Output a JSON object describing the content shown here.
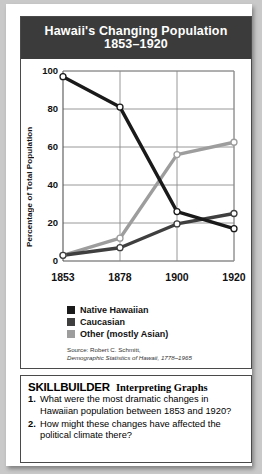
{
  "figure": {
    "title_line1": "Hawaii's Changing Population",
    "title_line2": "1853–1920",
    "source_line1": "Source: Robert C. Schmitt,",
    "source_line2": "Demographic Statistics of Hawaii, 1778–1965"
  },
  "colors": {
    "title_bar_bg": "#3b3b3b",
    "panel_border": "#4a4a4a",
    "native_hawaiian": "#1a1a1a",
    "caucasian": "#3f3f3f",
    "other": "#9d9d9d",
    "grid": "#8c8c8c",
    "axis": "#555555",
    "marker_fill": "#ffffff"
  },
  "legend": {
    "items": [
      {
        "label": "Native Hawaiian",
        "color": "#1a1a1a"
      },
      {
        "label": "Caucasian",
        "color": "#3f3f3f"
      },
      {
        "label": "Other (mostly Asian)",
        "color": "#9d9d9d"
      }
    ]
  },
  "skillbuilder": {
    "title": "SKILLBUILDER",
    "subtitle": "Interpreting Graphs",
    "questions": [
      {
        "num": "1.",
        "text": "What were the most dramatic changes in Hawaiian population between 1853 and 1920?"
      },
      {
        "num": "2.",
        "text": "How might these changes have affected the political climate there?"
      }
    ]
  },
  "chart_data": {
    "type": "line",
    "title": "Hawaii's Changing Population 1853–1920",
    "xlabel": "",
    "ylabel": "Percentage of Total Population",
    "categories": [
      "1853",
      "1878",
      "1900",
      "1920"
    ],
    "x": [
      1853,
      1878,
      1900,
      1920
    ],
    "ylim": [
      0,
      100
    ],
    "yticks": [
      0,
      20,
      40,
      60,
      80,
      100
    ],
    "ytick_labels": [
      "0",
      "20",
      "40",
      "60",
      "80",
      "100"
    ],
    "grid": true,
    "legend_position": "below",
    "series": [
      {
        "name": "Native Hawaiian",
        "color": "#1a1a1a",
        "values": [
          97,
          81,
          26,
          17
        ]
      },
      {
        "name": "Caucasian",
        "color": "#3f3f3f",
        "values": [
          3,
          7,
          19.5,
          25
        ]
      },
      {
        "name": "Other (mostly Asian)",
        "color": "#9d9d9d",
        "values": [
          3,
          12,
          56,
          62.5
        ]
      }
    ]
  }
}
